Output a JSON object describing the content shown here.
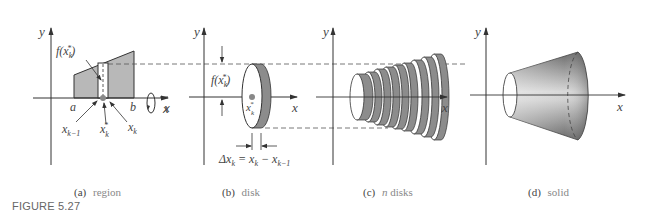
{
  "figure": {
    "label": "FIGURE 5.27",
    "panels": [
      {
        "id": "a",
        "tag": "(a)",
        "caption": "region",
        "labels": {
          "y_axis": "y",
          "x_axis": "x",
          "f": "f(x",
          "f_sub": "k",
          "f_sup": "*",
          "a": "a",
          "b": "b",
          "xkm1": "x",
          "xkm1_sub": "k−1",
          "xks": "x",
          "xks_sub": "k",
          "xks_sup": "*",
          "xk": "x",
          "xk_sub": "k"
        }
      },
      {
        "id": "b",
        "tag": "(b)",
        "caption": "disk",
        "labels": {
          "y_axis": "y",
          "x_axis": "x",
          "x_left": "x",
          "f": "f(x",
          "f_sub": "k",
          "f_sup": "*",
          "xks": "x",
          "xks_sub": "k",
          "xks_sup": "*",
          "delta": "Δx",
          "delta_sub": "k",
          "eq": " = x",
          "eq_sub1": "k",
          "minus": " − x",
          "eq_sub2": "k−1"
        }
      },
      {
        "id": "c",
        "tag": "(c)",
        "caption_italic": "n",
        "caption": " disks",
        "labels": {
          "y_axis": "y",
          "x_axis": "x"
        }
      },
      {
        "id": "d",
        "tag": "(d)",
        "caption": "solid",
        "labels": {
          "y_axis": "y",
          "x_axis": "x"
        }
      }
    ]
  },
  "colors": {
    "line": "#333333",
    "region_fill": "#b8b8b8",
    "disk_edge": "#8c8c8c",
    "disk_face": "#ffffff",
    "dashed": "#555555"
  }
}
